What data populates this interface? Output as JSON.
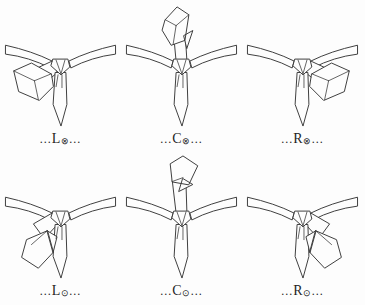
{
  "colors": {
    "background": "#fdfdfd",
    "ink": "#3d3d3d",
    "label": "#1f1f1f"
  },
  "cells": [
    {
      "id": "L-out",
      "dots_before": "...",
      "letter": "L",
      "symbol": "⊗",
      "dots_after": "...",
      "art": {
        "neck": "M5,46 Q32,52 52,62 L50,69 Q29,58 5,55 Z M116,46 Q89,52 69,62 L71,69 Q92,58 116,55 Z",
        "band": "M52,62 L37,69 L46,83 L57,74 Z",
        "narrow": "M55,74 L53,106 L61,128 L67,106 L66,74 Z",
        "blade": "M51,75 L31,64 L13,72 L18,93 L39,102 L53,88 Z",
        "blade_lines": "M13,72 L34,82 M34,82 L51,75 M34,82 L38,101",
        "knot": "M53,60 L68,60 L70,68 L61,76 L51,67 Z",
        "details": "M56,61 L61,75 M65,61 L61,75 M58,76 L56,88 M62,76 L62,89"
      }
    },
    {
      "id": "C-out",
      "dots_before": "...",
      "letter": "C",
      "symbol": "⊗",
      "dots_after": "...",
      "art": {
        "neck": "M5,46 Q32,52 52,62 L50,69 Q29,58 5,55 Z M116,46 Q89,52 69,62 L71,69 Q92,58 116,55 Z",
        "band": "M55,62 L52,30 L64,30 L66,62 Z",
        "narrow": "M55,74 L53,106 L61,128 L67,106 L66,74 Z",
        "blade": "M44,20 L56,7 L68,15 L64,41 L50,46 L41,31 Z M63,36 L72,31 L66,49 Z",
        "blade_lines": "M44,20 L55,26 M68,15 L55,26 M55,26 L52,45",
        "knot": "M53,60 L68,60 L70,68 L61,76 L51,67 Z",
        "details": "M56,61 L61,75 M65,61 L61,75 M58,76 L56,88 M62,76 L62,89"
      }
    },
    {
      "id": "R-out",
      "dots_before": "...",
      "letter": "R",
      "symbol": "⊗",
      "dots_after": "...",
      "art": {
        "neck": "M5,46 Q32,52 52,62 L50,69 Q29,58 5,55 Z M116,46 Q89,52 69,62 L71,69 Q92,58 116,55 Z",
        "band": "M69,62 L84,69 L75,83 L64,74 Z",
        "narrow": "M55,74 L53,106 L61,128 L67,106 L66,74 Z",
        "blade": "M70,75 L90,64 L108,72 L103,93 L82,102 L68,88 Z",
        "blade_lines": "M108,72 L87,82 M87,82 L70,75 M87,82 L83,101",
        "knot": "M53,60 L68,60 L70,68 L61,76 L51,67 Z",
        "details": "M56,61 L61,75 M65,61 L61,75 M58,76 L56,88 M62,76 L62,89"
      }
    },
    {
      "id": "L-in",
      "dots_before": "...",
      "letter": "L",
      "symbol": "⊙",
      "dots_after": "...",
      "art": {
        "neck": "M5,46 Q32,52 52,62 L50,69 Q29,58 5,55 Z M116,46 Q89,52 69,62 L71,69 Q92,58 116,55 Z",
        "band": "M52,62 L33,73 L44,88 L58,73 Z",
        "narrow": "M55,74 L53,106 L61,128 L67,106 L66,74 Z",
        "blade": "M47,80 L26,89 L21,107 L38,118 L53,102 Z M47,80 L57,86 L53,102 Z",
        "blade_lines": "M47,80 L31,94",
        "knot": "M53,60 L68,60 L70,68 L61,76 L51,67 Z",
        "details": "M56,61 L61,75 M65,61 L61,75 M58,76 L56,88 M62,76 L62,89"
      }
    },
    {
      "id": "C-in",
      "dots_before": "...",
      "letter": "C",
      "symbol": "⊙",
      "dots_after": "...",
      "art": {
        "neck": "M5,46 Q32,52 52,62 L50,69 Q29,58 5,55 Z M116,46 Q89,52 69,62 L71,69 Q92,58 116,55 Z",
        "band": "M55,62 L51,28 L65,30 L66,62 Z",
        "narrow": "M55,74 L53,106 L61,128 L67,106 L66,74 Z",
        "blade": "M51,30 L49,12 L62,4 L77,14 L68,33 Z M62,27 L72,33 L58,40 Z",
        "blade_lines": "M51,30 L62,26",
        "knot": "M53,60 L68,60 L70,68 L61,76 L51,67 Z",
        "details": "M56,61 L61,75 M65,61 L61,75 M58,76 L56,88 M62,76 L62,89"
      }
    },
    {
      "id": "R-in",
      "dots_before": "...",
      "letter": "R",
      "symbol": "⊙",
      "dots_after": "...",
      "art": {
        "neck": "M5,46 Q32,52 52,62 L50,69 Q29,58 5,55 Z M116,46 Q89,52 69,62 L71,69 Q92,58 116,55 Z",
        "band": "M69,62 L88,73 L77,88 L63,73 Z",
        "narrow": "M55,74 L53,106 L61,128 L67,106 L66,74 Z",
        "blade": "M74,80 L95,89 L100,107 L83,118 L68,102 Z M74,80 L64,86 L68,102 Z",
        "blade_lines": "M74,80 L90,94",
        "knot": "M53,60 L68,60 L70,68 L61,76 L51,67 Z",
        "details": "M56,61 L61,75 M65,61 L61,75 M58,76 L56,88 M62,76 L62,89"
      }
    }
  ]
}
